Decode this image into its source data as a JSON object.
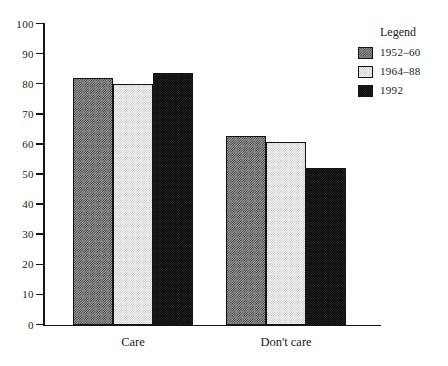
{
  "chart_data": {
    "type": "bar",
    "title": "",
    "xlabel": "",
    "ylabel": "",
    "ylim": [
      0,
      100
    ],
    "ytick_step": 10,
    "ytick_labels": [
      "100",
      "90",
      "80",
      "70",
      "60",
      "50",
      "40",
      "30",
      "20",
      "10",
      "0"
    ],
    "ytick_values": [
      100,
      90,
      80,
      70,
      60,
      50,
      40,
      30,
      20,
      10,
      0
    ],
    "grid": false,
    "legend_position": "top-right",
    "categories": [
      "Care",
      "Don't care"
    ],
    "series": [
      {
        "name": "1952–60",
        "values": [
          82,
          62.5
        ],
        "color": "#9a9a9a",
        "fill": "hatch-mid"
      },
      {
        "name": "1964–88",
        "values": [
          80,
          60.5
        ],
        "color": "#f4f4f4",
        "fill": "hatch-light"
      },
      {
        "name": "1992",
        "values": [
          83.5,
          52
        ],
        "color": "#0b0b0b",
        "fill": "hatch-dark"
      }
    ]
  },
  "legend": {
    "title": "Legend",
    "entries": [
      {
        "label": "1952–60"
      },
      {
        "label": "1964–88"
      },
      {
        "label": "1992"
      }
    ]
  },
  "axes": {
    "y_labels": [
      "100",
      "90",
      "80",
      "70",
      "60",
      "50",
      "40",
      "30",
      "20",
      "10",
      "0"
    ],
    "x_labels": [
      "Care",
      "Don't care"
    ]
  }
}
